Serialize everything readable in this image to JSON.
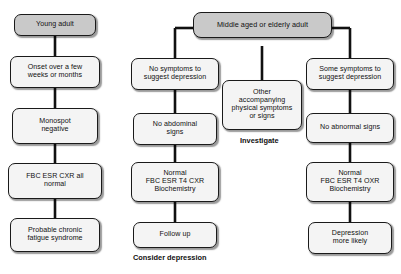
{
  "diagram": {
    "background_color": "#ffffff",
    "shaded_node_color": "#c9c9c9",
    "node_color": "#f4f4f4",
    "line_color": "#111111"
  },
  "branches": {
    "young_adult": {
      "root_label": "Young adult",
      "steps": [
        "Onset over a few\nweeks or months",
        "Monospot\nnegative",
        "FBC  ESR  CXR all\nnormal",
        "Probable chronic\nfatigue syndrome"
      ]
    },
    "middle_aged": {
      "root_label": "Middle aged or elderly adult",
      "left": {
        "steps": [
          "No symptoms to\nsuggest depression",
          "No abdominal\nsigns",
          "Normal\nFBC  ESR  T4  CXR\nBiochemistry",
          "Follow up"
        ],
        "caption": "Consider depression"
      },
      "center": {
        "steps": [
          "Other\naccompanying\nphysical symptoms\nor signs"
        ],
        "caption": "Investigate"
      },
      "right": {
        "steps": [
          "Some symptoms to\nsuggest depression",
          "No abnormal signs",
          "Normal\nFBC ESR  T4  OXR\nBiochemistry",
          "Depression\nmore likely"
        ],
        "caption": ""
      }
    }
  }
}
